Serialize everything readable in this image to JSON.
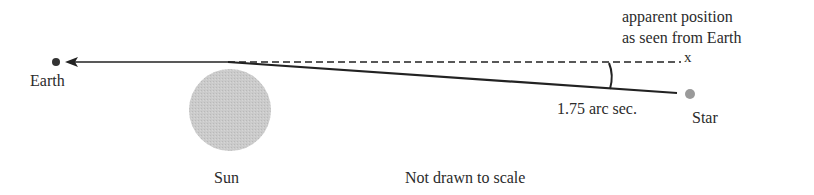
{
  "diagram": {
    "labels": {
      "earth": "Earth",
      "sun": "Sun",
      "star": "Star",
      "apparent_position_line1": "apparent position",
      "apparent_position_line2": "as seen from Earth",
      "apparent_marker": "x",
      "angle": "1.75 arc sec.",
      "note": "Not drawn to scale"
    },
    "objects": {
      "earth": {
        "cx": 56,
        "cy": 62,
        "r": 4,
        "color": "#333333"
      },
      "sun": {
        "cx": 230,
        "cy": 110,
        "r": 41,
        "color": "#c8c8c8"
      },
      "star": {
        "cx": 690,
        "cy": 94,
        "r": 5,
        "color": "#9a9a9a"
      }
    },
    "lines": {
      "arrow_to_earth": {
        "from": [
          228,
          62
        ],
        "to": [
          66,
          62
        ],
        "style": "solid-arrow"
      },
      "apparent_ray": {
        "from": [
          228,
          62
        ],
        "to": [
          682,
          62
        ],
        "style": "dashed"
      },
      "actual_ray": {
        "from": [
          228,
          62
        ],
        "to": [
          677,
          93
        ],
        "style": "solid"
      }
    },
    "deflection_angle": "1.75 arc sec.",
    "colors": {
      "line": "#222222",
      "text": "#2b2b2b"
    }
  }
}
